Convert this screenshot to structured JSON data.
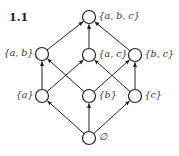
{
  "figure": {
    "label": "1.1"
  },
  "diagram": {
    "type": "hasse-diagram",
    "nodes": [
      {
        "id": "abc",
        "label": "{a, b, c}",
        "x": 89,
        "y": 17,
        "label_side": "right"
      },
      {
        "id": "ab",
        "label": "{a, b}",
        "x": 42,
        "y": 54,
        "label_side": "left"
      },
      {
        "id": "ac",
        "label": "{a, c}",
        "x": 89,
        "y": 55,
        "label_side": "right"
      },
      {
        "id": "bc",
        "label": "{b, c}",
        "x": 135,
        "y": 55,
        "label_side": "right"
      },
      {
        "id": "a",
        "label": "{a}",
        "x": 42,
        "y": 96,
        "label_side": "left"
      },
      {
        "id": "b",
        "label": "{b}",
        "x": 89,
        "y": 96,
        "label_side": "right"
      },
      {
        "id": "c",
        "label": "{c}",
        "x": 135,
        "y": 96,
        "label_side": "right"
      },
      {
        "id": "empty",
        "label": "∅",
        "x": 89,
        "y": 138,
        "label_side": "right"
      }
    ],
    "edges": [
      {
        "from": "empty",
        "to": "a"
      },
      {
        "from": "empty",
        "to": "b"
      },
      {
        "from": "empty",
        "to": "c"
      },
      {
        "from": "a",
        "to": "ab"
      },
      {
        "from": "a",
        "to": "ac"
      },
      {
        "from": "b",
        "to": "ab"
      },
      {
        "from": "b",
        "to": "bc"
      },
      {
        "from": "c",
        "to": "ac"
      },
      {
        "from": "c",
        "to": "bc"
      },
      {
        "from": "ab",
        "to": "abc"
      },
      {
        "from": "ac",
        "to": "abc"
      },
      {
        "from": "bc",
        "to": "abc"
      }
    ]
  }
}
